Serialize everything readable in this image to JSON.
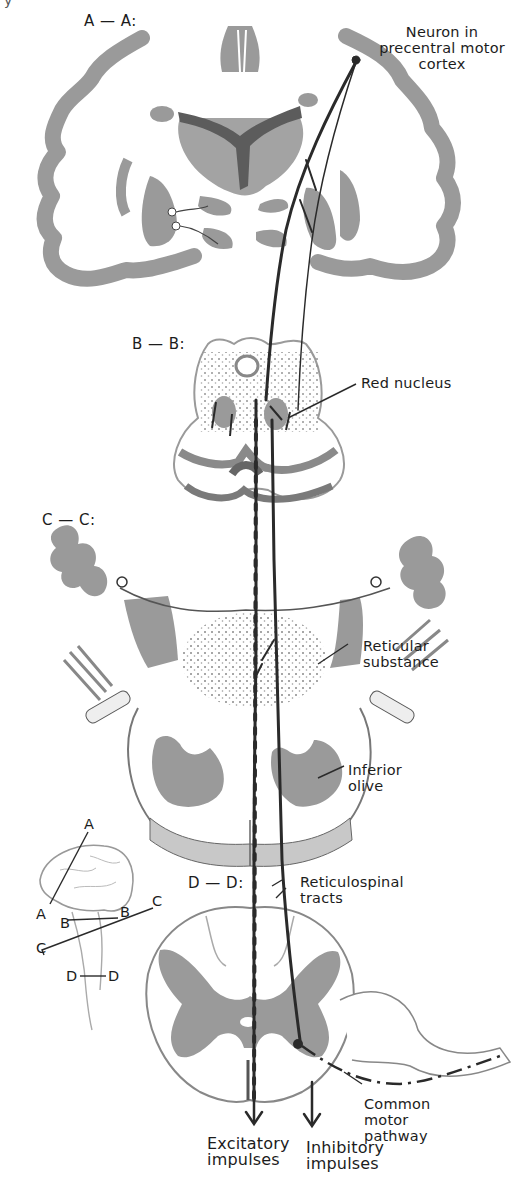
{
  "figure": {
    "colors": {
      "background": "#ffffff",
      "gray_matter": "#9a9a9a",
      "dark_structure": "#5a5a5a",
      "tract_line": "#2a2a2a",
      "text": "#1c1c1c"
    }
  },
  "sections": {
    "a": "A — A:",
    "b": "B — B:",
    "c": "C — C:",
    "d": "D — D:"
  },
  "labels": {
    "neuron": "Neuron in\nprecentral motor\ncortex",
    "red_nucleus": "Red nucleus",
    "reticular": "Reticular\nsubstance",
    "inferior_olive": "Inferior\nolive",
    "reticulospinal": "Reticulospinal\ntracts",
    "common_motor": "Common\nmotor\npathway",
    "excitatory": "Excitatory\nimpulses",
    "inhibitory": "Inhibitory\nimpulses"
  },
  "inset": {
    "a_top": "A",
    "a_bottom": "A",
    "b_left": "B",
    "b_right": "B",
    "c_left": "C",
    "c_right": "C",
    "d_left": "D",
    "d_right": "D"
  },
  "corner_mark": "y"
}
